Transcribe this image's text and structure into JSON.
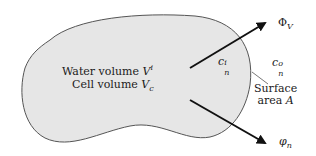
{
  "diagram": {
    "cell": {
      "fill": "#e6e6e6",
      "stroke": "#555555",
      "water_volume_label": "Water volume",
      "water_volume_symbol": "V",
      "water_volume_sup": "i",
      "cell_volume_label": "Cell volume",
      "cell_volume_symbol": "V",
      "cell_volume_sub": "c"
    },
    "concentrations": {
      "inside_symbol": "c",
      "inside_sub": "n",
      "inside_sup": "i",
      "outside_symbol": "c",
      "outside_sub": "n",
      "outside_sup": "o"
    },
    "fluxes": {
      "volume_flux_symbol": "Φ",
      "volume_flux_sub": "V",
      "solute_flux_symbol": "φ",
      "solute_flux_sub": "n",
      "arrow_color": "#111111"
    },
    "surface": {
      "line1": "Surface",
      "line2": "area",
      "symbol": "A"
    }
  }
}
